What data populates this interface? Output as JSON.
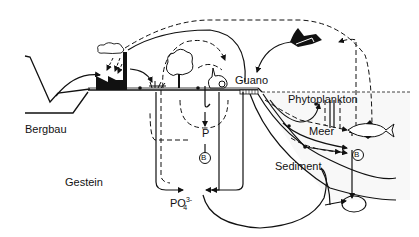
{
  "diagram": {
    "type": "phosphorus-cycle",
    "labels": {
      "bergbau": "Bergbau",
      "gestein": "Gestein",
      "guano": "Guano",
      "phytoplankton": "Phytoplankton",
      "meer": "Meer",
      "sediment": "Sediment",
      "p": "P",
      "phosphate_base": "PO",
      "phosphate_charge": "3-",
      "phosphate_index": "4",
      "bacteria_marker": "B"
    },
    "icons": [
      "factory-icon",
      "smoke-cloud-icon",
      "tree-icon",
      "rabbit-icon",
      "bird-icon",
      "fish-icon",
      "plant-icon"
    ],
    "colors": {
      "line": "#111111",
      "background": "#ffffff",
      "water_speckle": "#d8d8d8"
    }
  }
}
